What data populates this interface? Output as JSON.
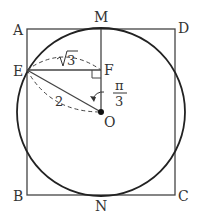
{
  "points": {
    "A": "A",
    "M": "M",
    "D": "D",
    "E": "E",
    "F": "F",
    "O": "O",
    "B": "B",
    "N": "N",
    "C": "C"
  },
  "annotations": {
    "sqrt3": "√3",
    "sqrt3_radicand": "3",
    "radius_label": "2",
    "angle_num": "π",
    "angle_den": "3"
  },
  "colors": {
    "stroke": "#333333",
    "background": "#ffffff"
  }
}
